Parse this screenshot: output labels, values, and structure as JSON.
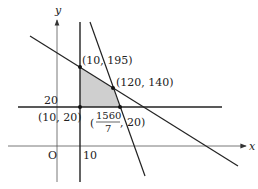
{
  "diagram": {
    "type": "linear-programming-feasible-region",
    "axes": {
      "x_label": "x",
      "y_label": "y",
      "origin_label": "O",
      "x_tick_label": "10",
      "y_tick_label": "20"
    },
    "vertices": [
      {
        "label": "(10, 195)"
      },
      {
        "label": "(120, 140)"
      },
      {
        "label": "(10, 20)"
      },
      {
        "label_prefix": "(",
        "numerator": "1560",
        "denominator": "7",
        "label_suffix": ", 20)"
      }
    ],
    "colors": {
      "line": "#222222",
      "axis": "#555555",
      "region_fill": "#cfcfcf"
    }
  }
}
